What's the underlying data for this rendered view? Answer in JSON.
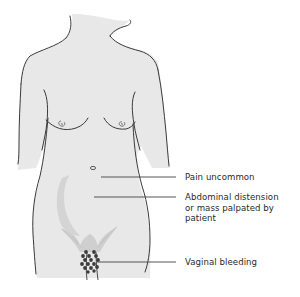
{
  "figure": {
    "colors": {
      "skin": "#e8e8e8",
      "outline": "#3a3a3a",
      "shadow": "#d2d2d2",
      "pubic_hair": "#cfcfcf",
      "bleeding_drops": "#3c3c3c",
      "leader_line": "#444444",
      "text": "#2a2a2a"
    }
  },
  "annotations": [
    {
      "label": "Pain uncommon",
      "lines": [
        "Pain uncommon"
      ]
    },
    {
      "label": "Abdominal distension or mass palpated by patient",
      "lines": [
        "Abdominal distension",
        "or mass palpated by",
        "patient"
      ]
    },
    {
      "label": "Vaginal bleeding",
      "lines": [
        "Vaginal bleeding"
      ]
    }
  ]
}
